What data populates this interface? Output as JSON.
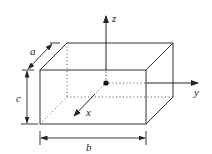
{
  "diagram": {
    "type": "rectangular-box-with-axes",
    "colors": {
      "stroke": "#333333",
      "text": "#222222",
      "background": "#ffffff"
    },
    "axes": {
      "x": {
        "label": "x"
      },
      "y": {
        "label": "y"
      },
      "z": {
        "label": "z"
      }
    },
    "dimensions": {
      "a": {
        "label": "a",
        "meaning": "depth"
      },
      "b": {
        "label": "b",
        "meaning": "width"
      },
      "c": {
        "label": "c",
        "meaning": "height"
      }
    },
    "origin": {
      "marker": "filled-dot"
    }
  }
}
